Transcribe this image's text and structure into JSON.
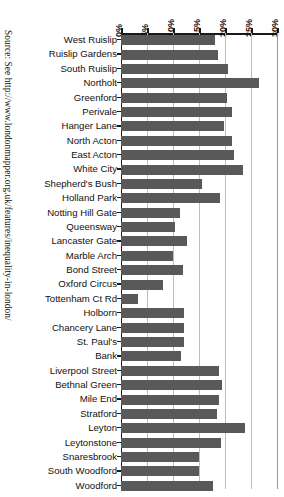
{
  "figure": {
    "source_note": "Source: See http://www.londonmapper.org.uk/features/inequality-in-london/"
  },
  "chart_data": {
    "type": "bar",
    "orientation": "horizontal",
    "title": "",
    "subtitle": "",
    "xlabel": "",
    "ylabel": "",
    "xlim": [
      0,
      30
    ],
    "xticks": [
      0,
      5,
      10,
      15,
      20,
      25,
      30
    ],
    "xtick_labels": [
      "0%",
      "5%",
      "10%",
      "15%",
      "20%",
      "25%",
      "30%"
    ],
    "grid": true,
    "axis_position": "top",
    "legend": "none",
    "bar_color": "#595959",
    "categories": [
      "West Ruislip",
      "Ruislip Gardens",
      "South Ruislip",
      "Northolt",
      "Greenford",
      "Perivale",
      "Hanger Lane",
      "North Acton",
      "East Acton",
      "White City",
      "Shepherd's Bush",
      "Holland Park",
      "Notting Hill Gate",
      "Queensway",
      "Lancaster Gate",
      "Marble Arch",
      "Bond Street",
      "Oxford Circus",
      "Tottenham Ct Rd",
      "Holborn",
      "Chancery Lane",
      "St. Paul's",
      "Bank",
      "Liverpool Street",
      "Bethnal Green",
      "Mile End",
      "Stratford",
      "Leyton",
      "Leytonstone",
      "Snaresbrook",
      "South Woodford",
      "Woodford"
    ],
    "values": [
      18.0,
      18.6,
      20.6,
      26.6,
      20.4,
      21.3,
      19.8,
      21.3,
      21.7,
      23.4,
      15.6,
      19.0,
      11.4,
      10.4,
      12.7,
      10.0,
      12.0,
      8.0,
      3.2,
      12.2,
      12.2,
      12.2,
      11.5,
      18.8,
      19.5,
      18.8,
      18.4,
      23.8,
      19.3,
      15.0,
      15.0,
      17.6
    ]
  }
}
